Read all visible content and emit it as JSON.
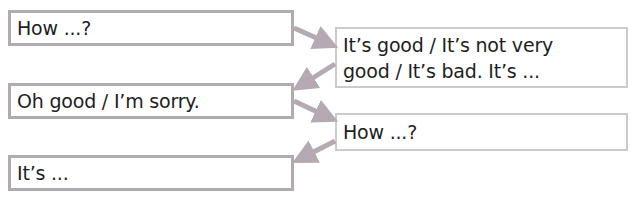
{
  "diagram": {
    "type": "conversation-flow",
    "colors": {
      "box_border": "#b1aab0",
      "arrow": "#b5aab3",
      "text": "#1e1e1e"
    },
    "boxes": [
      {
        "id": "box1",
        "side": "left",
        "text": "How ...?"
      },
      {
        "id": "box2",
        "side": "right",
        "line1": "It’s good / It’s not very",
        "line2": "good / It’s bad. It’s ..."
      },
      {
        "id": "box3",
        "side": "left",
        "text": "Oh good / I’m sorry."
      },
      {
        "id": "box4",
        "side": "right",
        "text": "How ...?"
      },
      {
        "id": "box5",
        "side": "left",
        "text": "It’s ..."
      }
    ],
    "arrows": [
      {
        "from": "box1",
        "to": "box2"
      },
      {
        "from": "box2",
        "to": "box3"
      },
      {
        "from": "box3",
        "to": "box4"
      },
      {
        "from": "box4",
        "to": "box5"
      }
    ]
  }
}
